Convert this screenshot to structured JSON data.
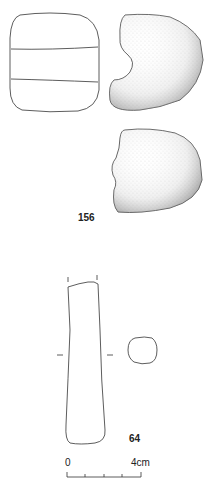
{
  "plate": {
    "objects": [
      {
        "id": "156",
        "label": "156",
        "views": [
          "front-outline",
          "side-stippled",
          "back-stippled"
        ]
      },
      {
        "id": "64",
        "label": "64",
        "views": [
          "elongated-outline",
          "cross-section"
        ]
      }
    ],
    "scale_bar": {
      "start_label": "0",
      "end_label": "4cm",
      "ticks": 4
    }
  },
  "colors": {
    "ink": "#333333",
    "background": "#ffffff"
  }
}
